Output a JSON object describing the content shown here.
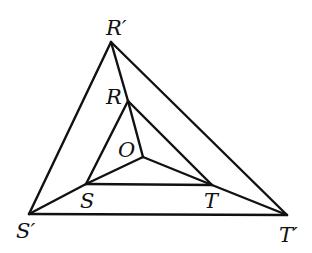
{
  "diagram": {
    "colors": {
      "stroke": "#111111",
      "background": "#ffffff"
    },
    "points": {
      "R_prime": {
        "label": "R′",
        "x": 111,
        "y": 42
      },
      "S_prime": {
        "label": "S′",
        "x": 29,
        "y": 214
      },
      "T_prime": {
        "label": "T′",
        "x": 287,
        "y": 215
      },
      "R": {
        "label": "R",
        "x": 128,
        "y": 101
      },
      "S": {
        "label": "S",
        "x": 86,
        "y": 184
      },
      "T": {
        "label": "T",
        "x": 212,
        "y": 185
      },
      "O": {
        "label": "O",
        "x": 143,
        "y": 157
      }
    },
    "edges": [
      [
        "R_prime",
        "S_prime"
      ],
      [
        "S_prime",
        "T_prime"
      ],
      [
        "T_prime",
        "R_prime"
      ],
      [
        "R",
        "S"
      ],
      [
        "S",
        "T"
      ],
      [
        "T",
        "R"
      ],
      [
        "R_prime",
        "R"
      ],
      [
        "S_prime",
        "S"
      ],
      [
        "T_prime",
        "T"
      ],
      [
        "O",
        "R"
      ],
      [
        "O",
        "S"
      ],
      [
        "O",
        "T"
      ]
    ],
    "labels": {
      "R_prime": "R′",
      "S_prime": "S′",
      "T_prime": "T′",
      "R": "R",
      "S": "S",
      "T": "T",
      "O": "O"
    }
  }
}
